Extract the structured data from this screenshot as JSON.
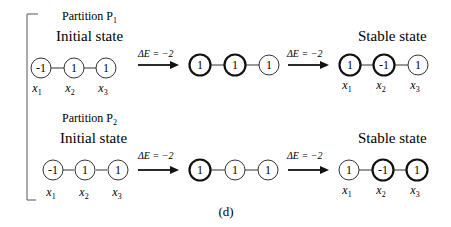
{
  "figure": {
    "caption": "(d)",
    "rows": [
      {
        "partition_label": "Partition P",
        "partition_sub": "1",
        "initial_label": "Initial state",
        "stable_label": "Stable state",
        "arrow1": "ΔE = −2",
        "arrow2": "ΔE = −2",
        "states": [
          {
            "values": [
              "-1",
              "1",
              "1"
            ],
            "bold": [
              false,
              false,
              false
            ]
          },
          {
            "values": [
              "1",
              "1",
              "1"
            ],
            "bold": [
              true,
              true,
              false
            ]
          },
          {
            "values": [
              "1",
              "-1",
              "1"
            ],
            "bold": [
              true,
              true,
              false
            ]
          }
        ],
        "vars": [
          "x",
          "x",
          "x"
        ],
        "var_subs": [
          "1",
          "2",
          "3"
        ]
      },
      {
        "partition_label": "Partition P",
        "partition_sub": "2",
        "initial_label": "Initial state",
        "stable_label": "Stable state",
        "arrow1": "ΔE = −2",
        "arrow2": "ΔE = −2",
        "states": [
          {
            "values": [
              "-1",
              "1",
              "1"
            ],
            "bold": [
              false,
              false,
              false
            ]
          },
          {
            "values": [
              "1",
              "1",
              "1"
            ],
            "bold": [
              true,
              false,
              false
            ]
          },
          {
            "values": [
              "1",
              "-1",
              "1"
            ],
            "bold": [
              false,
              true,
              true
            ]
          }
        ],
        "vars": [
          "x",
          "x",
          "x"
        ],
        "var_subs": [
          "1",
          "2",
          "3"
        ]
      }
    ]
  }
}
